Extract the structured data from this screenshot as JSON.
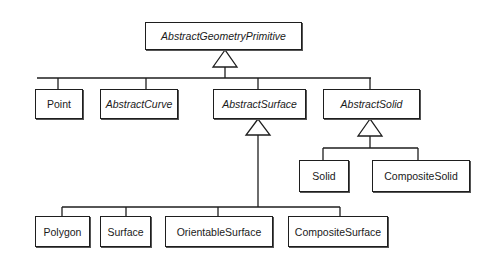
{
  "diagram": {
    "type": "uml-class-hierarchy",
    "root": {
      "label": "AbstractGeometryPrimitive",
      "abstract": true
    },
    "level1": [
      {
        "label": "Point",
        "abstract": false
      },
      {
        "label": "AbstractCurve",
        "abstract": true
      },
      {
        "label": "AbstractSurface",
        "abstract": true
      },
      {
        "label": "AbstractSolid",
        "abstract": true
      }
    ],
    "surface_children": [
      {
        "label": "Polygon",
        "abstract": false
      },
      {
        "label": "Surface",
        "abstract": false
      },
      {
        "label": "OrientableSurface",
        "abstract": false
      },
      {
        "label": "CompositeSurface",
        "abstract": false
      }
    ],
    "solid_children": [
      {
        "label": "Solid",
        "abstract": false
      },
      {
        "label": "CompositeSolid",
        "abstract": false
      }
    ],
    "relationships": [
      {
        "from": [
          "Point",
          "AbstractCurve",
          "AbstractSurface",
          "AbstractSolid"
        ],
        "to": "AbstractGeometryPrimitive",
        "kind": "generalization"
      },
      {
        "from": [
          "Polygon",
          "Surface",
          "OrientableSurface",
          "CompositeSurface"
        ],
        "to": "AbstractSurface",
        "kind": "generalization"
      },
      {
        "from": [
          "Solid",
          "CompositeSolid"
        ],
        "to": "AbstractSolid",
        "kind": "generalization"
      }
    ],
    "colors": {
      "line": "#1e1e1e",
      "background": "#ffffff"
    }
  }
}
